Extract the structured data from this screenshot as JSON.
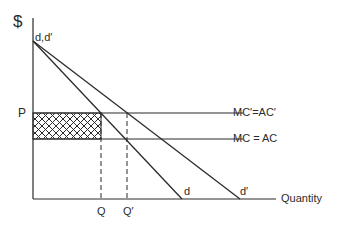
{
  "diagram": {
    "axes": {
      "y_label": "$",
      "x_label": "Quantity"
    },
    "curves": {
      "origin_label": "d,d′",
      "demand_d": "d",
      "demand_d_prime": "d′",
      "cost_high": "MC′=AC′",
      "cost_low": "MC = AC"
    },
    "price_label": "P",
    "quantity_labels": {
      "q": "Q",
      "q_prime": "Q′"
    },
    "shaded_region": "crosshatched rectangle between P and MC=AC from axis to Q",
    "colors": {
      "line": "#2b2b2b",
      "background": "#ffffff"
    }
  }
}
